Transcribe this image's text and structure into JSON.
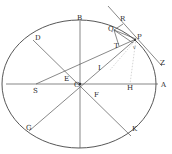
{
  "figure": {
    "type": "geometric-diagram",
    "ellipse": {
      "cx": 79,
      "cy": 84,
      "rx": 77,
      "ry": 64
    },
    "labels": {
      "B": "B",
      "D": "D",
      "E": "E",
      "I": "I",
      "S": "S",
      "C": "C",
      "F": "F",
      "H": "H",
      "A": "A",
      "G": "G",
      "K": "K",
      "R": "R",
      "Q": "Q",
      "T": "T",
      "P": "P",
      "Z": "Z",
      "v": "v"
    }
  }
}
